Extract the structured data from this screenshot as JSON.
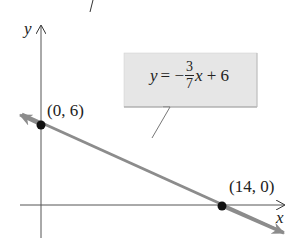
{
  "diagram": {
    "axes": {
      "x_label": "x",
      "y_label": "y"
    },
    "line": {
      "equation_lhs": "y = −",
      "numerator": "3",
      "denominator": "7",
      "equation_rhs": "x + 6",
      "slope": "-3/7",
      "intercept": 6,
      "color": "#8c8c8c"
    },
    "points": [
      {
        "label": "(0, 6)",
        "x": 0,
        "y": 6
      },
      {
        "label": "(14, 0)",
        "x": 14,
        "y": 0
      }
    ],
    "callout_bg": "#e6e6e6",
    "top_mark": "/"
  }
}
